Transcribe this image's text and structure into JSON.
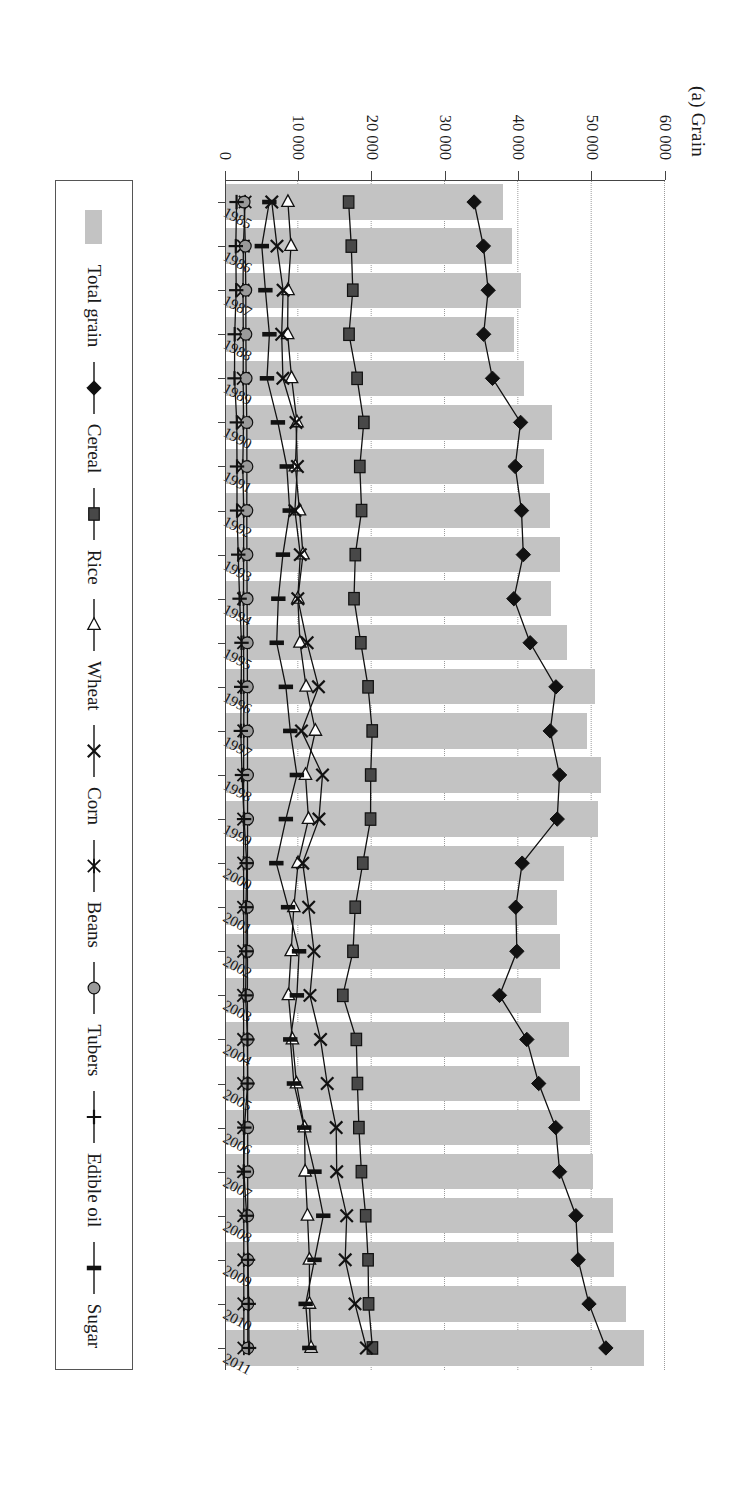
{
  "figure": {
    "title": "(a) Grain",
    "plot_bg": "#ffffff",
    "bar_color": "#c3c3c3",
    "line_color": "#1a1a1a"
  },
  "axis": {
    "y_ticks": [
      "0",
      "10 000",
      "20 000",
      "30 000",
      "40 000",
      "50 000",
      "60 000"
    ],
    "y_values": [
      0,
      10000,
      20000,
      30000,
      40000,
      50000,
      60000
    ],
    "y_min": 0,
    "y_max": 60000,
    "grid": "dotted vertical at each y tick",
    "x_label": "",
    "y_label": ""
  },
  "legend": {
    "position": "bottom",
    "items": [
      {
        "label": "Total grain",
        "marker": "filled-bar-swatch",
        "color": "#c3c3c3"
      },
      {
        "label": "Cereal",
        "marker": "filled-diamond",
        "color": "#1a1a1a"
      },
      {
        "label": "Rice",
        "marker": "filled-square",
        "color": "#454545"
      },
      {
        "label": "Wheat",
        "marker": "open-triangle",
        "color": "#1a1a1a"
      },
      {
        "label": "Corn",
        "marker": "x-cross",
        "color": "#1a1a1a"
      },
      {
        "label": "Beans",
        "marker": "asterisk",
        "color": "#1a1a1a"
      },
      {
        "label": "Tubers",
        "marker": "filled-circle",
        "color": "#8f8f8f"
      },
      {
        "label": "Edible oil",
        "marker": "plus-cross",
        "color": "#1a1a1a"
      },
      {
        "label": "Sugar",
        "marker": "vertical-bar",
        "color": "#1a1a1a"
      }
    ]
  },
  "chart_data": {
    "type": "bar",
    "title": "(a) Grain",
    "xlabel": "",
    "ylabel": "",
    "ylim": [
      0,
      60000
    ],
    "grid": true,
    "legend_position": "bottom",
    "categories": [
      "1985",
      "1986",
      "1987",
      "1988",
      "1989",
      "1990",
      "1991",
      "1992",
      "1993",
      "1994",
      "1995",
      "1996",
      "1997",
      "1998",
      "1999",
      "2000",
      "2001",
      "2002",
      "2003",
      "2004",
      "2005",
      "2006",
      "2007",
      "2008",
      "2009",
      "2010",
      "2011"
    ],
    "series": [
      {
        "name": "Total grain",
        "kind": "bar",
        "values": [
          37911,
          39151,
          40298,
          39408,
          40755,
          44624,
          43529,
          44266,
          45649,
          44510,
          46662,
          50454,
          49417,
          51230,
          50839,
          46218,
          45264,
          45706,
          43070,
          46947,
          48402,
          49748,
          50160,
          52871,
          53082,
          54648,
          57121
        ]
      },
      {
        "name": "Cereal",
        "kind": "line",
        "marker": "filled-diamond",
        "values": [
          33966,
          35239,
          35891,
          35270,
          36479,
          40309,
          39566,
          40435,
          40683,
          39389,
          41611,
          45127,
          44349,
          45625,
          45304,
          40522,
          39648,
          39799,
          37429,
          41157,
          42776,
          45099,
          45624,
          47847,
          48156,
          49637,
          51939
        ]
      },
      {
        "name": "Rice",
        "kind": "line",
        "marker": "filled-square",
        "values": [
          16857,
          17222,
          17426,
          16911,
          18013,
          18933,
          18381,
          18622,
          17770,
          17593,
          18523,
          19510,
          20074,
          19871,
          19849,
          18791,
          17758,
          17454,
          16066,
          17909,
          18059,
          18257,
          18603,
          19190,
          19510,
          19576,
          20100
        ]
      },
      {
        "name": "Wheat",
        "kind": "line",
        "marker": "open-triangle",
        "values": [
          8581,
          9004,
          8590,
          8543,
          9081,
          9823,
          9595,
          10159,
          10639,
          9930,
          10221,
          11057,
          12329,
          10973,
          11388,
          9964,
          9387,
          9029,
          8649,
          9195,
          9745,
          10847,
          10930,
          11246,
          11512,
          11518,
          11740
        ]
      },
      {
        "name": "Corn",
        "kind": "line",
        "marker": "x-cross",
        "values": [
          6383,
          7086,
          7924,
          7735,
          7893,
          9682,
          9877,
          9538,
          10270,
          9928,
          11199,
          12747,
          10431,
          13295,
          12809,
          10600,
          11409,
          12131,
          11583,
          13029,
          13937,
          15160,
          15230,
          16591,
          16397,
          17725,
          19278
        ]
      },
      {
        "name": "Beans",
        "kind": "line",
        "marker": "asterisk",
        "values": [
          2744,
          2504,
          2457,
          2500,
          2478,
          2522,
          2424,
          2550,
          2532,
          2528,
          2536,
          2550,
          2558,
          2542,
          2546,
          2540,
          2534,
          2554,
          2530,
          2540,
          2545,
          2550,
          2555,
          2560,
          2565,
          2570,
          2575
        ]
      },
      {
        "name": "Tubers",
        "kind": "line",
        "marker": "filled-circle",
        "values": [
          2605,
          2769,
          2831,
          2847,
          2880,
          2974,
          2988,
          2976,
          2990,
          3018,
          3036,
          3050,
          3064,
          3070,
          3080,
          3060,
          3050,
          3065,
          3055,
          3070,
          3082,
          3090,
          3095,
          3100,
          3105,
          3110,
          3115
        ]
      },
      {
        "name": "Edible oil",
        "kind": "line",
        "marker": "plus-cross",
        "values": [
          1578,
          1474,
          1528,
          1320,
          1295,
          1613,
          1638,
          1641,
          1804,
          1990,
          2250,
          2211,
          2157,
          2314,
          2601,
          2955,
          2865,
          2897,
          2811,
          3066,
          3077,
          2640,
          2569,
          2953,
          3139,
          3230,
          3279
        ]
      },
      {
        "name": "Sugar",
        "kind": "line",
        "marker": "vertical-bar",
        "values": [
          6047,
          5021,
          5508,
          6059,
          5722,
          7215,
          8421,
          8827,
          7899,
          7270,
          7054,
          8300,
          8900,
          9800,
          8300,
          7000,
          8600,
          10100,
          9800,
          8900,
          9400,
          10800,
          12200,
          13400,
          12200,
          11000,
          11500
        ]
      }
    ]
  }
}
